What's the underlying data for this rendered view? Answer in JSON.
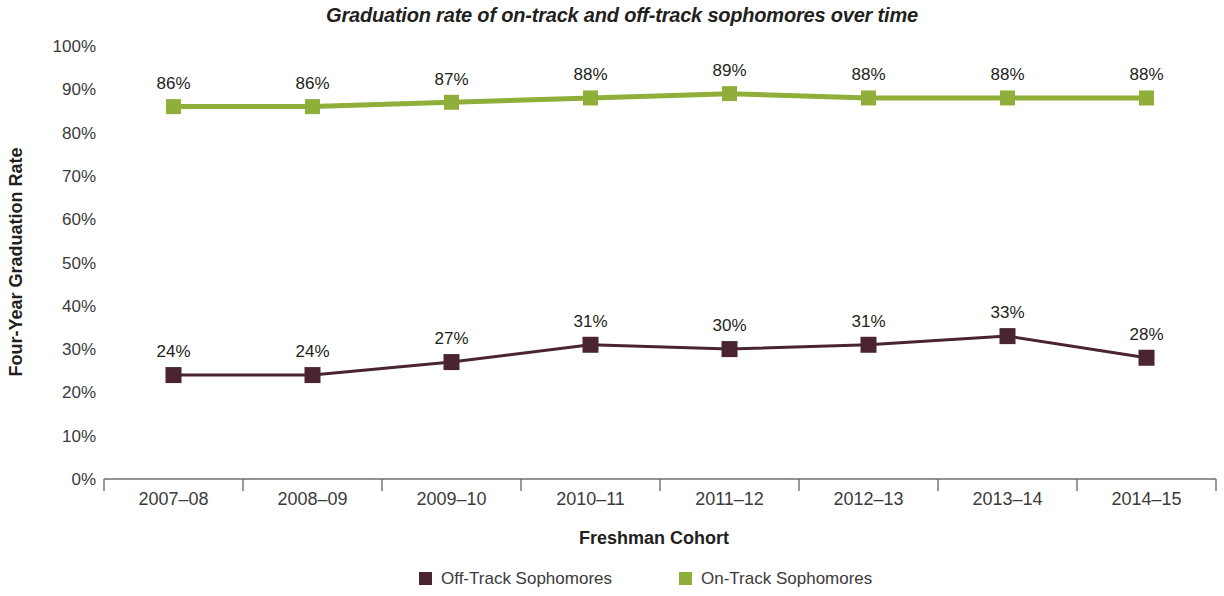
{
  "chart_data": {
    "type": "line",
    "title": "Graduation rate of on-track and off-track sophomores over time",
    "xlabel": "Freshman Cohort",
    "ylabel": "Four-Year Graduation Rate",
    "categories": [
      "2007–08",
      "2008–09",
      "2009–10",
      "2010–11",
      "2011–12",
      "2012–13",
      "2013–14",
      "2014–15"
    ],
    "ylim": [
      0,
      100
    ],
    "ytick_labels": [
      "100%",
      "90%",
      "80%",
      "70%",
      "60%",
      "50%",
      "40%",
      "30%",
      "20%",
      "10%",
      "0%"
    ],
    "ytick_values": [
      100,
      90,
      80,
      70,
      60,
      50,
      40,
      30,
      20,
      10,
      0
    ],
    "grid": false,
    "legend_position": "bottom",
    "marker": "square",
    "series": [
      {
        "name": "Off-Track Sophomores",
        "color": "#4A2530",
        "values": [
          24,
          24,
          27,
          31,
          30,
          31,
          33,
          28
        ],
        "labels": [
          "24%",
          "24%",
          "27%",
          "31%",
          "30%",
          "31%",
          "33%",
          "28%"
        ]
      },
      {
        "name": "On-Track Sophomores",
        "color": "#8FAF3A",
        "values": [
          86,
          86,
          87,
          88,
          89,
          88,
          88,
          88
        ],
        "labels": [
          "86%",
          "86%",
          "87%",
          "88%",
          "89%",
          "88%",
          "88%",
          "88%"
        ]
      }
    ]
  }
}
